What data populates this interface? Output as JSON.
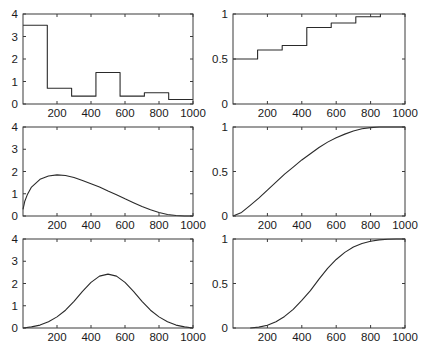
{
  "chart_data": [
    {
      "id": "hist",
      "type": "bar",
      "subtype": "histogram-step",
      "title": "",
      "xlabel": "",
      "ylabel": "",
      "xlim": [
        0,
        1000
      ],
      "ylim": [
        0,
        4
      ],
      "xticks": [
        200,
        400,
        600,
        800,
        1000
      ],
      "xtick_labels": [
        "200",
        "400",
        "600",
        "800",
        "1000"
      ],
      "yticks": [
        0,
        1,
        2,
        3,
        4
      ],
      "ytick_labels": [
        "0",
        "1",
        "2",
        "3",
        "4"
      ],
      "bin_edges": [
        0,
        143,
        286,
        429,
        571,
        714,
        857,
        1000
      ],
      "values": [
        3.5,
        0.7,
        0.35,
        1.4,
        0.35,
        0.5,
        0.2
      ],
      "grid": false
    },
    {
      "id": "ecdf",
      "type": "line",
      "subtype": "step-cdf",
      "title": "",
      "xlabel": "",
      "ylabel": "",
      "xlim": [
        0,
        1000
      ],
      "ylim": [
        0,
        1
      ],
      "xticks": [
        200,
        400,
        600,
        800,
        1000
      ],
      "xtick_labels": [
        "200",
        "400",
        "600",
        "800",
        "1000"
      ],
      "yticks": [
        0,
        0.5,
        1
      ],
      "ytick_labels": [
        "0",
        "0.5",
        "1"
      ],
      "step_edges": [
        0,
        143,
        286,
        429,
        571,
        714,
        857
      ],
      "values": [
        0.5,
        0.6,
        0.65,
        0.85,
        0.9,
        0.97,
        1.0
      ],
      "grid": false
    },
    {
      "id": "beta-pdf-skewed",
      "type": "line",
      "title": "",
      "xlabel": "",
      "ylabel": "",
      "xlim": [
        0,
        1000
      ],
      "ylim": [
        0,
        4
      ],
      "xticks": [
        200,
        400,
        600,
        800,
        1000
      ],
      "xtick_labels": [
        "200",
        "400",
        "600",
        "800",
        "1000"
      ],
      "yticks": [
        0,
        1,
        2,
        3,
        4
      ],
      "ytick_labels": [
        "0",
        "1",
        "2",
        "3",
        "4"
      ],
      "x": [
        0,
        10,
        25,
        50,
        100,
        150,
        200,
        250,
        300,
        350,
        400,
        450,
        500,
        550,
        600,
        650,
        700,
        750,
        800,
        850,
        900,
        950,
        1000
      ],
      "values": [
        0.3,
        0.65,
        0.95,
        1.3,
        1.65,
        1.8,
        1.85,
        1.82,
        1.73,
        1.6,
        1.45,
        1.3,
        1.12,
        0.95,
        0.77,
        0.6,
        0.43,
        0.28,
        0.16,
        0.07,
        0.02,
        0.0,
        0.0
      ],
      "grid": false
    },
    {
      "id": "beta-cdf-skewed",
      "type": "line",
      "title": "",
      "xlabel": "",
      "ylabel": "",
      "xlim": [
        0,
        1000
      ],
      "ylim": [
        0,
        1
      ],
      "xticks": [
        200,
        400,
        600,
        800,
        1000
      ],
      "xtick_labels": [
        "200",
        "400",
        "600",
        "800",
        "1000"
      ],
      "yticks": [
        0,
        0.5,
        1
      ],
      "ytick_labels": [
        "0",
        "0.5",
        "1"
      ],
      "x": [
        0,
        50,
        100,
        150,
        200,
        250,
        300,
        350,
        400,
        450,
        500,
        550,
        600,
        650,
        700,
        750,
        800,
        850,
        900,
        950,
        1000
      ],
      "values": [
        0.0,
        0.04,
        0.12,
        0.2,
        0.29,
        0.38,
        0.47,
        0.55,
        0.63,
        0.7,
        0.77,
        0.83,
        0.88,
        0.92,
        0.955,
        0.98,
        0.993,
        1.0,
        1.0,
        1.0,
        1.0
      ],
      "grid": false
    },
    {
      "id": "beta-pdf-symmetric",
      "type": "line",
      "title": "",
      "xlabel": "",
      "ylabel": "",
      "xlim": [
        0,
        1000
      ],
      "ylim": [
        0,
        4
      ],
      "xticks": [
        200,
        400,
        600,
        800,
        1000
      ],
      "xtick_labels": [
        "200",
        "400",
        "600",
        "800",
        "1000"
      ],
      "yticks": [
        0,
        1,
        2,
        3,
        4
      ],
      "ytick_labels": [
        "0",
        "1",
        "2",
        "3",
        "4"
      ],
      "x": [
        0,
        50,
        100,
        150,
        200,
        250,
        300,
        350,
        400,
        450,
        500,
        550,
        600,
        650,
        700,
        750,
        800,
        850,
        900,
        950,
        1000
      ],
      "values": [
        0.0,
        0.05,
        0.13,
        0.28,
        0.5,
        0.8,
        1.2,
        1.65,
        2.05,
        2.33,
        2.42,
        2.33,
        2.05,
        1.65,
        1.2,
        0.8,
        0.5,
        0.28,
        0.13,
        0.05,
        0.0
      ],
      "grid": false
    },
    {
      "id": "beta-cdf-symmetric",
      "type": "line",
      "title": "",
      "xlabel": "",
      "ylabel": "",
      "xlim": [
        0,
        1000
      ],
      "ylim": [
        0,
        1
      ],
      "xticks": [
        200,
        400,
        600,
        800,
        1000
      ],
      "xtick_labels": [
        "200",
        "400",
        "600",
        "800",
        "1000"
      ],
      "yticks": [
        0,
        0.5,
        1
      ],
      "ytick_labels": [
        "0",
        "0.5",
        "1"
      ],
      "x": [
        100,
        150,
        200,
        250,
        300,
        350,
        400,
        450,
        500,
        550,
        600,
        650,
        700,
        750,
        800,
        850,
        900,
        950,
        1000
      ],
      "values": [
        0.0,
        0.01,
        0.03,
        0.07,
        0.13,
        0.21,
        0.31,
        0.42,
        0.55,
        0.67,
        0.77,
        0.85,
        0.91,
        0.95,
        0.975,
        0.99,
        0.997,
        1.0,
        1.0
      ],
      "grid": false
    }
  ],
  "layout": {
    "panels": [
      {
        "left": 23,
        "top": 14,
        "width": 170,
        "height": 90
      },
      {
        "left": 233,
        "top": 14,
        "width": 172,
        "height": 90
      },
      {
        "left": 23,
        "top": 127,
        "width": 170,
        "height": 89
      },
      {
        "left": 233,
        "top": 127,
        "width": 172,
        "height": 89
      },
      {
        "left": 23,
        "top": 239,
        "width": 170,
        "height": 89
      },
      {
        "left": 233,
        "top": 239,
        "width": 172,
        "height": 89
      }
    ],
    "line_color": "#2a2a2a",
    "axis_color": "#3a3a3a"
  }
}
